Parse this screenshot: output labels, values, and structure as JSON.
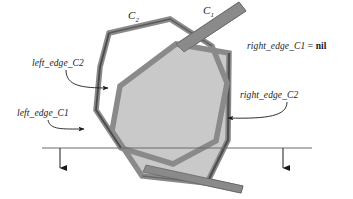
{
  "figure": {
    "type": "computational-geometry-diagram",
    "colors": {
      "fill": "#c9c9c9",
      "outline": "#8a8a8a",
      "outline_dark": "#4a4a4a",
      "sweep_line": "#6b6b6b",
      "text": "#1a1a1a",
      "background": "#ffffff"
    }
  },
  "labels": {
    "curve_c2": {
      "name": "C",
      "sub": "2"
    },
    "curve_c1": {
      "name": "C",
      "sub": "1"
    },
    "left_edge_c2": "left_edge_C2",
    "left_edge_c1": "left_edge_C1",
    "right_edge_c2": "right_edge_C2",
    "right_edge_c1_expr": {
      "lhs": "right_edge_C1",
      "op": "=",
      "rhs": "nil"
    }
  },
  "sweep_line": {
    "y": 148,
    "x_start": 42,
    "x_end": 312,
    "arrows": [
      {
        "x": 60,
        "y_from": 148,
        "y_to": 174
      },
      {
        "x": 283,
        "y_from": 148,
        "y_to": 174
      }
    ]
  }
}
